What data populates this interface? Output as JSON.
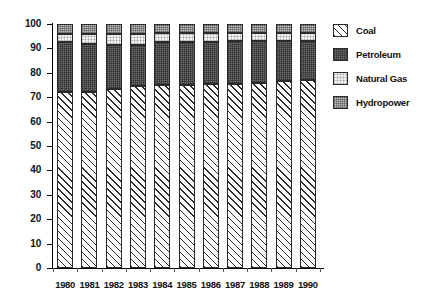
{
  "chart_data": {
    "type": "bar",
    "stacked": true,
    "title": "",
    "subtitle": "",
    "xlabel": "",
    "ylabel": "",
    "categories": [
      "1980",
      "1981",
      "1982",
      "1983",
      "1984",
      "1985",
      "1986",
      "1987",
      "1988",
      "1989",
      "1990"
    ],
    "ylim": [
      0,
      100
    ],
    "yticks": [
      0,
      10,
      20,
      30,
      40,
      50,
      60,
      70,
      80,
      90,
      100
    ],
    "ytick_labels": [
      "0",
      "10",
      "20",
      "30",
      "40",
      "50",
      "60",
      "70",
      "80",
      "90",
      "100"
    ],
    "grid": false,
    "legend_position": "right",
    "series": [
      {
        "name": "Coal",
        "pattern": "diagonal-hatch",
        "color": "#ffffff",
        "values": [
          72.0,
          72.0,
          73.5,
          74.5,
          75.0,
          75.0,
          75.5,
          75.5,
          76.0,
          76.5,
          77.0
        ]
      },
      {
        "name": "Petroleum",
        "pattern": "dark-stipple",
        "color": "#6e6e6e",
        "values": [
          20.5,
          20.0,
          18.0,
          17.0,
          17.5,
          17.5,
          17.0,
          17.5,
          17.0,
          16.5,
          16.0
        ]
      },
      {
        "name": "Natural Gas",
        "pattern": "light-stipple",
        "color": "#f2f2f2",
        "values": [
          3.5,
          4.0,
          4.5,
          4.5,
          4.0,
          4.0,
          4.0,
          3.5,
          3.5,
          3.5,
          3.5
        ]
      },
      {
        "name": "Hydropower",
        "pattern": "medium-stipple",
        "color": "#bdbdbd",
        "values": [
          4.0,
          4.0,
          4.0,
          4.0,
          3.5,
          3.5,
          3.5,
          3.5,
          3.5,
          3.5,
          3.5
        ]
      }
    ]
  },
  "legend": {
    "items": [
      {
        "label": "Coal",
        "swatch": "coal-swatch"
      },
      {
        "label": "Petroleum",
        "swatch": "petroleum-swatch"
      },
      {
        "label": "Natural Gas",
        "swatch": "natural-gas-swatch"
      },
      {
        "label": "Hydropower",
        "swatch": "hydropower-swatch"
      }
    ]
  }
}
